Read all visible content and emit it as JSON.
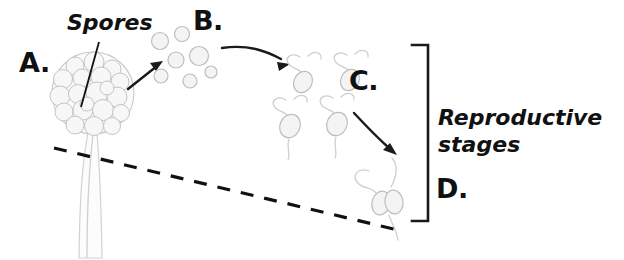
{
  "figure": {
    "background_color": "#ffffff",
    "ink_color": "#111111",
    "organic_outline_color": "#c9c9c9"
  },
  "labels": {
    "a": "A.",
    "b": "B.",
    "c": "C.",
    "d": "D.",
    "spores": "Spores",
    "bracket_line1": "Reproductive",
    "bracket_line2": "stages"
  },
  "stages": [
    {
      "key": "a",
      "label": "A.",
      "name": "sporangium-on-stalk",
      "description": "Spore-filled sporangium capsule atop a vertical stalk"
    },
    {
      "key": "b",
      "label": "B.",
      "name": "released-spores",
      "description": "Cluster of released free-floating round spores",
      "spore_count": 7
    },
    {
      "key": "c",
      "label": "C.",
      "name": "germinating-spores",
      "description": "Spores germinating with emerging hyphal threads",
      "cell_count": 4
    },
    {
      "key": "d",
      "label": "D.",
      "name": "fused-gametes",
      "description": "Two fused cells with hyphae, conjugating pair",
      "cell_count": 2
    }
  ],
  "annotations": {
    "spores_leader": "Leader line from Spores label into sporangium",
    "dashed_ground_line": "Dashed substrate/ground boundary line",
    "bracket": "Right-side bracket grouping stages B through D"
  },
  "arrows": [
    {
      "name": "arrow-a-to-b",
      "from": "A.",
      "to": "B.",
      "style": "straight"
    },
    {
      "name": "arrow-b-to-c",
      "from": "B.",
      "to": "C.",
      "style": "curved"
    },
    {
      "name": "arrow-c-to-d",
      "from": "C.",
      "to": "D.",
      "style": "curved"
    }
  ]
}
